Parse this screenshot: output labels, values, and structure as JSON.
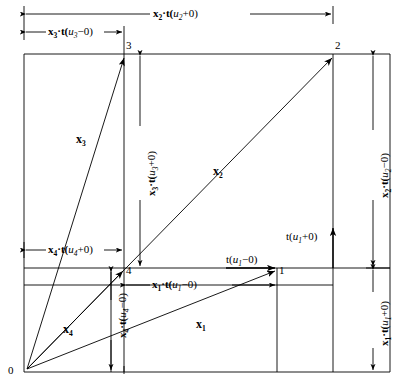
{
  "figure": {
    "type": "diagram",
    "title": "",
    "background": "#ffffff",
    "line_color": "#000000",
    "width": 398,
    "height": 389
  },
  "origin": {
    "label": "0"
  },
  "nodes": [
    {
      "id": "3",
      "label": "3",
      "x": 124,
      "y": 54
    },
    {
      "id": "2",
      "label": "2",
      "x": 333,
      "y": 54
    },
    {
      "id": "4",
      "label": "4",
      "x": 124,
      "y": 268
    },
    {
      "id": "1",
      "label": "1",
      "x": 277,
      "y": 268
    }
  ],
  "vectors": [
    {
      "name": "x3",
      "label": "x",
      "sub": "3"
    },
    {
      "name": "x2",
      "label": "x",
      "sub": "2"
    },
    {
      "name": "x4",
      "label": "x",
      "sub": "4"
    },
    {
      "name": "x1",
      "label": "x",
      "sub": "1"
    }
  ],
  "dimensions": {
    "top_outer": {
      "pre": "x",
      "sub": "2",
      "mid": "·t(",
      "var": "u",
      "varsub": "2",
      "post": "+0)"
    },
    "top_inner": {
      "pre": "x",
      "sub": "3",
      "mid": "·t(",
      "var": "u",
      "varsub": "3",
      "post": "−0)"
    },
    "right_upper": {
      "pre": "x",
      "sub": "2",
      "mid": "·t(",
      "var": "u",
      "varsub": "2",
      "post": "−0)"
    },
    "right_lower": {
      "pre": "x",
      "sub": "1",
      "mid": "·t(",
      "var": "u",
      "varsub": "1",
      "post": "+0)"
    },
    "mid_vertical": {
      "pre": "x",
      "sub": "3",
      "mid": "·t(",
      "var": "u",
      "varsub": "3",
      "post": "+0)"
    },
    "low_vertical": {
      "pre": "x",
      "sub": "4",
      "mid": "·t(",
      "var": "u",
      "varsub": "4",
      "post": "−0)"
    },
    "mid_horizontal_left": {
      "pre": "x",
      "sub": "4",
      "mid": "·t(",
      "var": "u",
      "varsub": "4",
      "post": "+0)"
    },
    "mid_horizontal_right": {
      "pre": "x",
      "sub": "1",
      "mid": "·t(",
      "var": "u",
      "varsub": "1",
      "post": "−0)"
    }
  },
  "arrow_labels": {
    "t_u1_plus": {
      "pre": "t(",
      "var": "u",
      "varsub": "1",
      "post": "+0)"
    },
    "t_u1_minus": {
      "pre": "t(",
      "var": "u",
      "varsub": "1",
      "post": "−0)"
    }
  }
}
